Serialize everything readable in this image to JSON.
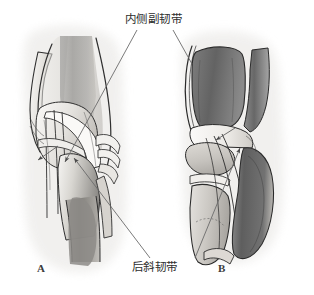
{
  "figure": {
    "background_color": "#ffffff",
    "width": 314,
    "height": 295,
    "style": "grayscale medical illustration"
  },
  "annotations": {
    "medial_collateral_ligament": {
      "label": "内侧副韧带",
      "translation": "Medial Collateral Ligament",
      "position": "top-center",
      "leader_lines": 2
    },
    "posterior_oblique_ligament": {
      "label": "后斜韧带",
      "translation": "Posterior Oblique Ligament",
      "position": "bottom-center",
      "leader_lines": 2
    }
  },
  "panels": [
    {
      "id": "A",
      "label": "A",
      "view": "medial view of knee joint",
      "arrow_count": 2
    },
    {
      "id": "B",
      "label": "B",
      "view": "posteromedial view of knee joint",
      "arrow_count": 2
    }
  ],
  "colors": {
    "background": "#ffffff",
    "halo": "#f0f0f0",
    "bone_light": "#f4f3f1",
    "bone_mid": "#dcdad6",
    "tissue_light": "#e8e6e2",
    "tissue_mid": "#c9c6c1",
    "muscle_dark": "#6f6f6f",
    "muscle_darker": "#555555",
    "muscle_mid": "#989898",
    "outline": "#2a2a2a",
    "leader_line": "#6b6b6b",
    "text": "#2e2e2e"
  }
}
